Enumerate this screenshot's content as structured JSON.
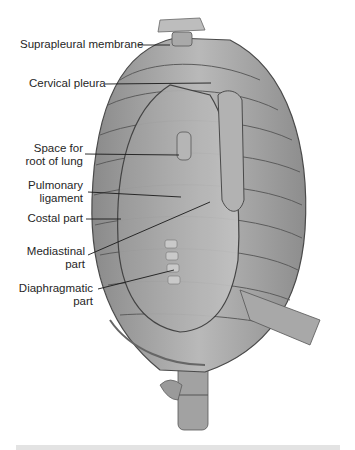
{
  "figure": {
    "labels": [
      {
        "id": "suprapleural",
        "lines": [
          "Suprapleural membrane"
        ]
      },
      {
        "id": "cervical",
        "lines": [
          "Cervical pleura"
        ]
      },
      {
        "id": "root",
        "lines": [
          "Space for",
          "root of lung"
        ]
      },
      {
        "id": "pulmonary",
        "lines": [
          "Pulmonary",
          "ligament"
        ]
      },
      {
        "id": "costal",
        "lines": [
          "Costal part"
        ]
      },
      {
        "id": "mediastinal",
        "lines": [
          "Mediastinal",
          "part"
        ]
      },
      {
        "id": "diaphragmatic",
        "lines": [
          "Diaphragmatic",
          "part"
        ]
      }
    ]
  },
  "colors": {
    "background": "#ffffff",
    "label_text": "#262626",
    "leader_line": "#1a1a1a",
    "footer_bar": "#e3e3e3"
  }
}
